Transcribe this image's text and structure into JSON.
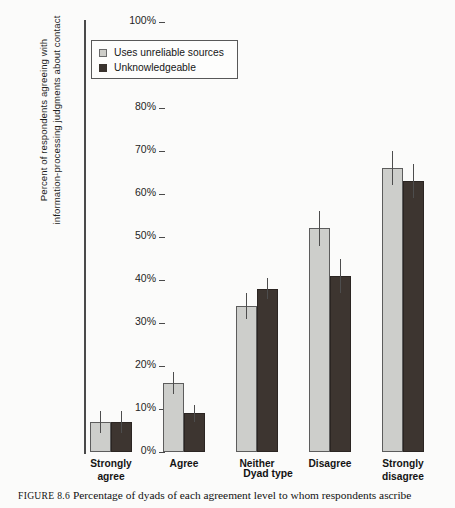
{
  "chart_data": {
    "type": "bar",
    "title": "",
    "xlabel": "Dyad type",
    "ylabel": "Percent of respondents agreeing with information-processing judgments about contact",
    "ylabel_lines": [
      "Percent of respondents agreeing with",
      "information-processing judgments about contact"
    ],
    "categories": [
      "Strongly agree",
      "Agree",
      "Neither",
      "Disagree",
      "Strongly disagree"
    ],
    "category_lines": [
      [
        "Strongly",
        "agree"
      ],
      [
        "Agree"
      ],
      [
        "Neither"
      ],
      [
        "Disagree"
      ],
      [
        "Strongly",
        "disagree"
      ]
    ],
    "series": [
      {
        "name": "Uses unreliable sources",
        "color": "#cdcecb",
        "values": [
          7,
          16,
          34,
          52,
          66
        ],
        "errors": [
          2.5,
          2.5,
          3,
          4,
          4
        ]
      },
      {
        "name": "Unknowledgeable",
        "color": "#3d3530",
        "values": [
          7,
          9,
          38,
          41,
          63
        ],
        "errors": [
          2.5,
          2,
          2.5,
          4,
          4
        ]
      }
    ],
    "ylim": [
      0,
      100
    ],
    "ytick_values": [
      0,
      10,
      20,
      30,
      40,
      50,
      60,
      70,
      80,
      90,
      100
    ],
    "ytick_labels": [
      "0%",
      "10%",
      "20%",
      "30%",
      "40%",
      "50%",
      "60%",
      "70%",
      "80%",
      "90%",
      "100%"
    ],
    "grid": false,
    "legend_position": "upper left",
    "error_bar_style": "vertical line, no caps"
  },
  "legend": {
    "items": [
      {
        "label": "Uses unreliable sources",
        "swatch": "light"
      },
      {
        "label": "Unknowledgeable",
        "swatch": "dark"
      }
    ]
  },
  "caption": {
    "figure_number": "FIGURE 8.6",
    "text": "Percentage of dyads of each agreement level to whom respondents ascribe"
  }
}
